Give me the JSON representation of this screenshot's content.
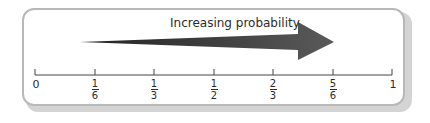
{
  "diagram": {
    "title": "Increasing probability",
    "arrow_color": "#555555",
    "axis": {
      "start_label": "0",
      "end_label": "1",
      "ticks": [
        {
          "numerator": "1",
          "denominator": "6"
        },
        {
          "numerator": "1",
          "denominator": "3"
        },
        {
          "numerator": "1",
          "denominator": "2"
        },
        {
          "numerator": "2",
          "denominator": "3"
        },
        {
          "numerator": "5",
          "denominator": "6"
        }
      ]
    }
  }
}
